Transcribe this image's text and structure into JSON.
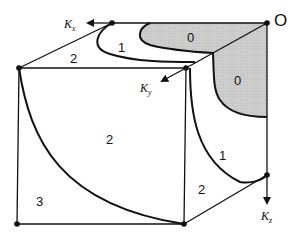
{
  "diagram": {
    "type": "cube-region-diagram",
    "origin_label": "O",
    "axes": [
      {
        "name": "Kx",
        "main": "K",
        "sub": "x",
        "direction": "left"
      },
      {
        "name": "Ky",
        "main": "K",
        "sub": "y",
        "direction": "diagonal-down-left"
      },
      {
        "name": "Kz",
        "main": "K",
        "sub": "z",
        "direction": "down"
      }
    ],
    "regions": [
      {
        "id": "top-shaded",
        "label": "0",
        "shaded": true
      },
      {
        "id": "right-shaded",
        "label": "0",
        "shaded": true
      },
      {
        "id": "top-band",
        "label": "1",
        "shaded": false
      },
      {
        "id": "right-band",
        "label": "1",
        "shaded": false
      },
      {
        "id": "top-face-outer",
        "label": "2",
        "shaded": false
      },
      {
        "id": "front-face-main",
        "label": "2",
        "shaded": false
      },
      {
        "id": "right-face-outer",
        "label": "2",
        "shaded": false
      },
      {
        "id": "front-corner",
        "label": "3",
        "shaded": false
      }
    ],
    "colors": {
      "line": "#111111",
      "shade": "#c8c8c8",
      "background": "#ffffff"
    }
  }
}
